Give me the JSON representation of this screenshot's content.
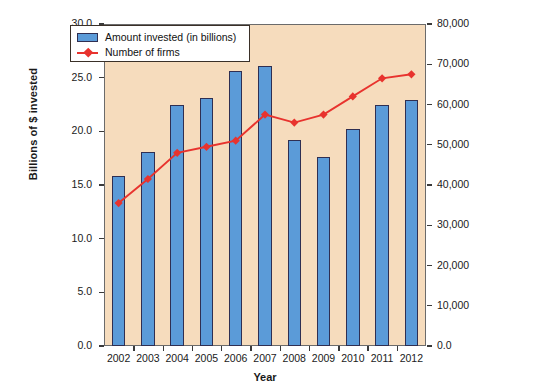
{
  "chart_data": {
    "type": "bar",
    "title": "",
    "xlabel": "Year",
    "ylabel": "Billions of $ invested",
    "y2label": "Number of small companies",
    "categories": [
      "2002",
      "2003",
      "2004",
      "2005",
      "2006",
      "2007",
      "2008",
      "2009",
      "2010",
      "2011",
      "2012"
    ],
    "ylim": [
      0.0,
      30.0
    ],
    "y2lim": [
      0,
      80000
    ],
    "yticks": [
      "0.0",
      "5.0",
      "10.0",
      "15.0",
      "20.0",
      "25.0",
      "30.0"
    ],
    "y2ticks": [
      "0.0",
      "10,000",
      "20,000",
      "30,000",
      "40,000",
      "50,000",
      "60,000",
      "70,000",
      "80,000"
    ],
    "grid": false,
    "legend_position": "top-left",
    "plot_background": "#f6dcbd",
    "series": [
      {
        "name": "Amount invested (in billions)",
        "type": "bar",
        "axis": "left",
        "color": "#5b9bd8",
        "values": [
          15.8,
          18.1,
          22.5,
          23.1,
          25.6,
          26.1,
          19.2,
          17.6,
          20.2,
          22.5,
          22.9
        ]
      },
      {
        "name": "Number of firms",
        "type": "line",
        "axis": "right",
        "color": "#e8332e",
        "values": [
          35500,
          41500,
          48000,
          49500,
          51000,
          57500,
          55500,
          57500,
          62000,
          66500,
          67500
        ]
      }
    ]
  },
  "legend": {
    "items": [
      {
        "label": "Amount invested (in billions)",
        "marker": "bar-swatch"
      },
      {
        "label": "Number of firms",
        "marker": "line-diamond"
      }
    ]
  },
  "axes": {
    "left_title": "Billions of $ invested",
    "right_title": "Number of small companies",
    "bottom_title": "Year"
  }
}
